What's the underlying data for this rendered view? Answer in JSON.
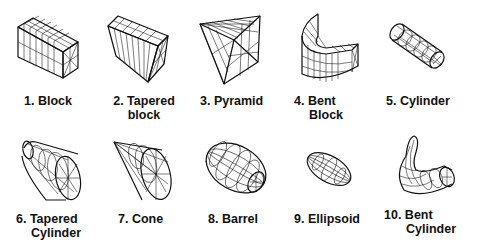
{
  "figure": {
    "title": "",
    "shapes": [
      {
        "number": "1.",
        "name": "Block",
        "line1": "1. Block",
        "line2": ""
      },
      {
        "number": "2.",
        "name": "Tapered block",
        "line1": "2. Tapered",
        "line2": "block"
      },
      {
        "number": "3.",
        "name": "Pyramid",
        "line1": "3. Pyramid",
        "line2": ""
      },
      {
        "number": "4.",
        "name": "Bent Block",
        "line1": "4. Bent",
        "line2": "Block"
      },
      {
        "number": "5.",
        "name": "Cylinder",
        "line1": "5. Cylinder",
        "line2": ""
      },
      {
        "number": "6.",
        "name": "Tapered Cylinder",
        "line1": "6. Tapered",
        "line2": "Cylinder"
      },
      {
        "number": "7.",
        "name": "Cone",
        "line1": "7. Cone",
        "line2": ""
      },
      {
        "number": "8.",
        "name": "Barrel",
        "line1": "8. Barrel",
        "line2": ""
      },
      {
        "number": "9.",
        "name": "Ellipsoid",
        "line1": "9. Ellipsoid",
        "line2": ""
      },
      {
        "number": "10.",
        "name": "Bent Cylinder",
        "line1": "10. Bent",
        "line2": "Cylinder"
      }
    ]
  },
  "colors": {
    "stroke": "#111111",
    "background": "#ffffff"
  }
}
